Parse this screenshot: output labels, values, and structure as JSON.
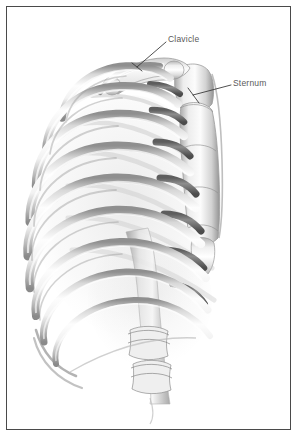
{
  "figure": {
    "style": "pencil-shaded anatomical illustration",
    "background_color": "#ffffff",
    "border_color": "#4a4a4a",
    "label_color": "#5a5a5a",
    "leader_color": "#3c3c3c",
    "bone_fill_light": "#fbfbfb",
    "bone_fill_mid": "#e2e2e2",
    "bone_shadow": "#9a9a9a",
    "cartilage_dark": "#6e6e6e"
  },
  "labels": [
    {
      "id": "clavicle",
      "text": "Clavicle",
      "x": 168,
      "y": 35,
      "leader_from": [
        166,
        42
      ],
      "leader_to": [
        137,
        67
      ]
    },
    {
      "id": "sternum",
      "text": "Sternum",
      "x": 233,
      "y": 79,
      "leader_from": [
        231,
        85
      ],
      "leader_to": [
        193,
        95
      ]
    }
  ],
  "anatomy": {
    "structures": [
      "clavicle",
      "sternum",
      "manubrium",
      "body-of-sternum",
      "xiphoid-process",
      "costal-cartilage",
      "true-ribs",
      "false-ribs",
      "floating-ribs",
      "thoracic-vertebrae",
      "lumbar-vertebrae"
    ],
    "rib_pair_count": 12,
    "visible_rib_arches": 10
  }
}
